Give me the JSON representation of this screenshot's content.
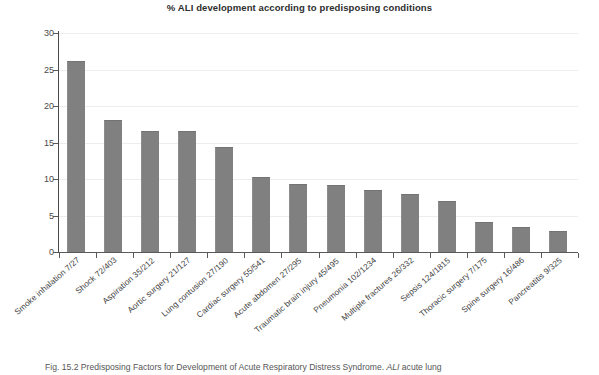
{
  "chart_data": {
    "type": "bar",
    "title": "% ALI development according to predisposing conditions",
    "xlabel": "",
    "ylabel": "",
    "ylim": [
      0,
      30
    ],
    "yticks": [
      0,
      5,
      10,
      15,
      20,
      25,
      30
    ],
    "grid": true,
    "legend": "none",
    "bar_color": "#808080",
    "categories": [
      "Smoke inhalation 7/27",
      "Shock 72/403",
      "Aspiration 35/212",
      "Aortic surgery 21/127",
      "Lung contusion 27/190",
      "Cardiac surgery 55/541",
      "Acute abdomen 27/295",
      "Traumatic brain injury 45/495",
      "Pneumonia 102/1234",
      "Multiple fractures 26/332",
      "Sepsis 124/1815",
      "Thoracic surgery 7/175",
      "Spine surgery 16/486",
      "Pancreatitis 9/325"
    ],
    "values": [
      26.0,
      17.9,
      16.5,
      16.5,
      14.2,
      10.2,
      9.2,
      9.1,
      8.3,
      7.8,
      6.8,
      4.0,
      3.3,
      2.8
    ]
  },
  "caption": {
    "prefix": "Fig. 15.2 Predisposing Factors for Development of Acute Respiratory Distress Syndrome. ",
    "abbrev": "ALI",
    "suffix": " acute lung"
  }
}
